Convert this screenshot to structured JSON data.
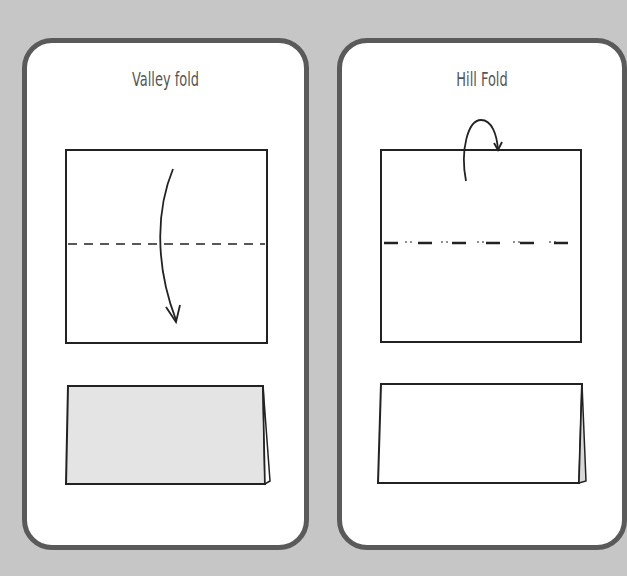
{
  "cards": [
    {
      "title": "Valley fold",
      "fold_line_style": "dashed",
      "arrow": "curved-down",
      "folded_result_fill": "#e4e4e4"
    },
    {
      "title": "Hill Fold",
      "fold_line_style": "dash-dot-dot",
      "arrow": "loop-over-back",
      "folded_result_fill": "#ffffff"
    }
  ],
  "colors": {
    "background": "#c6c6c6",
    "card_border": "#5a5a5a",
    "card_fill": "#ffffff",
    "line": "#222222",
    "title_text": "#555555"
  }
}
